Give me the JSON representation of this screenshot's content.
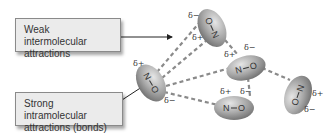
{
  "labels": {
    "weak": {
      "line1": "Weak intermolecular",
      "line2": "attractions"
    },
    "strong": {
      "line1": "Strong intramolecular",
      "line2": "attractions (bonds)"
    }
  },
  "molecules": [
    {
      "id": "top",
      "atoms": [
        "O",
        "N"
      ],
      "partial_charges": [
        "δ−",
        "δ+"
      ]
    },
    {
      "id": "left",
      "atoms": [
        "N",
        "O"
      ],
      "partial_charges": [
        "δ+",
        "δ−"
      ]
    },
    {
      "id": "middle-right",
      "atoms": [
        "N",
        "O"
      ],
      "partial_charges": [
        "δ+",
        "δ−"
      ]
    },
    {
      "id": "lower",
      "atoms": [
        "N",
        "O"
      ],
      "partial_charges": [
        "δ+",
        "δ−"
      ]
    },
    {
      "id": "far-right",
      "atoms": [
        "O",
        "N"
      ],
      "partial_charges": [
        "δ−",
        "δ+"
      ]
    }
  ],
  "colors": {
    "molecule_fill": "#9a9a9a",
    "dash": "#8a8a8a",
    "box_bg": "#ebebeb"
  }
}
